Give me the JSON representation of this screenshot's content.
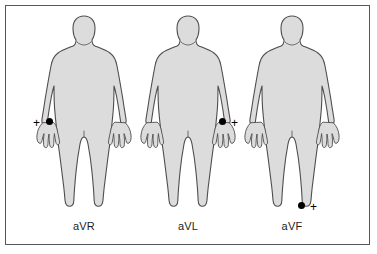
{
  "diagram": {
    "type": "ecg-augmented-limb-leads",
    "panel": {
      "border_color": "#58585a",
      "background_color": "#ffffff"
    },
    "body_style": {
      "fill_color": "#dcdcdc",
      "outline_color": "#4d4d4d",
      "electrode_color": "#000000"
    },
    "figures": [
      {
        "label": "aVR",
        "electrode_site": "right-arm-wrist",
        "polarity_symbol": "+",
        "polarity_side": "left",
        "electrode_x": 22,
        "electrode_y": 112,
        "polarity_x": 9,
        "polarity_y": 111
      },
      {
        "label": "aVL",
        "electrode_site": "left-arm-wrist",
        "polarity_symbol": "+",
        "polarity_side": "right",
        "electrode_x": 91,
        "electrode_y": 112,
        "polarity_x": 103,
        "polarity_y": 111
      },
      {
        "label": "aVF",
        "electrode_site": "left-leg-ankle",
        "polarity_symbol": "+",
        "polarity_side": "right",
        "electrode_x": 66,
        "electrode_y": 196,
        "polarity_x": 78,
        "polarity_y": 195
      }
    ]
  }
}
